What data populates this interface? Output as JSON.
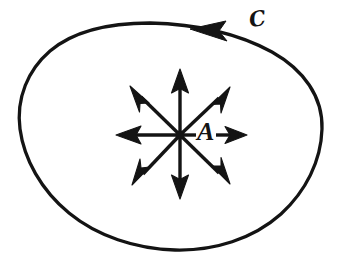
{
  "figure": {
    "background_color": "#ffffff",
    "ink_color": "#141414",
    "width": 344,
    "height": 267,
    "labels": {
      "curve_label": "ℎ",
      "curve_label_display": "C",
      "curve_label_meaning": "script-C",
      "point_label": "A"
    },
    "curve": {
      "name": "closed-curve",
      "orientation": "counterclockwise",
      "stroke_width": 3.2,
      "arrowhead_position_deg": 90,
      "style": "hand-drawn closed loop",
      "path": "M 150 23 C 196 24 238 34 272 52 C 303 69 322 96 322 128 C 322 160 307 190 282 213 C 254 238 215 251 176 250 C 137 249 98 236 70 213 C 42 190 25 159 21 129 C 17 99 28 71 50 51 C 76 29 112 23 150 23 Z"
    },
    "direction_arrowhead": {
      "name": "curve-direction-arrowhead",
      "tip_x": 192,
      "tip_y": 28,
      "angle_deg": 192
    },
    "vector_field": {
      "name": "radial-starburst",
      "center": {
        "x": 180,
        "y": 135
      },
      "arrow_count": 8,
      "shaft_width": 3.4,
      "arrows": [
        {
          "name": "arrow-up",
          "angle_deg": 270,
          "tip_x": 180,
          "tip_y": 70,
          "length": 65
        },
        {
          "name": "arrow-up-right",
          "angle_deg": 315,
          "tip_x": 228,
          "tip_y": 89,
          "length": 68
        },
        {
          "name": "arrow-right",
          "angle_deg": 0,
          "tip_x": 246,
          "tip_y": 135,
          "length": 66,
          "shaft_start_x": 216,
          "note": "shaft interrupted by label A"
        },
        {
          "name": "arrow-down-right",
          "angle_deg": 45,
          "tip_x": 228,
          "tip_y": 182,
          "length": 68
        },
        {
          "name": "arrow-down",
          "angle_deg": 90,
          "tip_x": 180,
          "tip_y": 198,
          "length": 63
        },
        {
          "name": "arrow-down-left",
          "angle_deg": 135,
          "tip_x": 134,
          "tip_y": 183,
          "length": 67
        },
        {
          "name": "arrow-left",
          "angle_deg": 180,
          "tip_x": 117,
          "tip_y": 135,
          "length": 63
        },
        {
          "name": "arrow-up-left",
          "angle_deg": 225,
          "tip_x": 132,
          "tip_y": 88,
          "length": 66
        }
      ]
    }
  }
}
